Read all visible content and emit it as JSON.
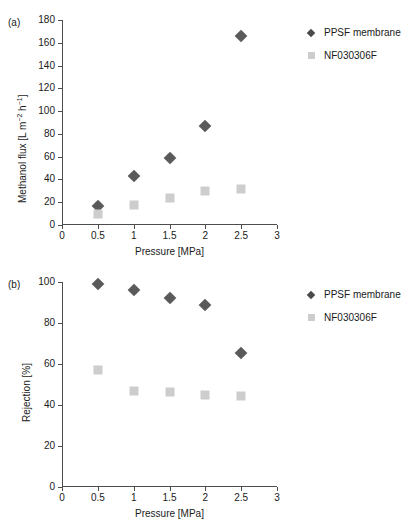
{
  "figure": {
    "panel_a_tag": "(a)",
    "panel_b_tag": "(b)"
  },
  "legend": {
    "series1_label": "PPSF membrane",
    "series2_label": "NF030306F",
    "series1_color": "#5a5a5a",
    "series2_color": "#cdcdcd",
    "series1_marker": "diamond",
    "series2_marker": "square",
    "position": "top-right"
  },
  "chart_data": [
    {
      "type": "scatter",
      "panel": "(a)",
      "title": "",
      "xlabel": "Pressure [MPa]",
      "ylabel": "Methanol flux [L m-2 h-1]",
      "ylabel_display": "Methanol flux [L m⁻² h⁻¹]",
      "x": [
        0.5,
        1,
        1.5,
        2,
        2.5
      ],
      "xlim": [
        0,
        3
      ],
      "ylim": [
        0,
        180
      ],
      "xticks": [
        0,
        0.5,
        1,
        1.5,
        2,
        2.5,
        3
      ],
      "xticklabels": [
        "0",
        "0.5",
        "1",
        "1.5",
        "2",
        "2.5",
        "3"
      ],
      "yticks": [
        0,
        20,
        40,
        60,
        80,
        100,
        120,
        140,
        160,
        180
      ],
      "yticklabels": [
        "0",
        "20",
        "40",
        "60",
        "80",
        "100",
        "120",
        "140",
        "160",
        "180"
      ],
      "grid": false,
      "series": [
        {
          "name": "PPSF membrane",
          "marker": "diamond",
          "color": "#5a5a5a",
          "values": [
            17,
            43,
            59,
            87,
            166
          ]
        },
        {
          "name": "NF030306F",
          "marker": "square",
          "color": "#cdcdcd",
          "values": [
            10,
            18,
            24,
            30,
            32
          ]
        }
      ]
    },
    {
      "type": "scatter",
      "panel": "(b)",
      "title": "",
      "xlabel": "Pressure [MPa]",
      "ylabel": "Rejection [%]",
      "ylabel_display": "Rejection [%]",
      "x": [
        0.5,
        1,
        1.5,
        2,
        2.5
      ],
      "xlim": [
        0,
        3
      ],
      "ylim": [
        0,
        100
      ],
      "xticks": [
        0,
        0.5,
        1,
        1.5,
        2,
        2.5,
        3
      ],
      "xticklabels": [
        "0",
        "0.5",
        "1",
        "1.5",
        "2",
        "2.5",
        "3"
      ],
      "yticks": [
        0,
        20,
        40,
        60,
        80,
        100
      ],
      "yticklabels": [
        "0",
        "20",
        "40",
        "60",
        "80",
        "100"
      ],
      "grid": false,
      "series": [
        {
          "name": "PPSF membrane",
          "marker": "diamond",
          "color": "#5a5a5a",
          "values": [
            99,
            96,
            92,
            89,
            65.5
          ]
        },
        {
          "name": "NF030306F",
          "marker": "square",
          "color": "#cdcdcd",
          "values": [
            57,
            47,
            46.5,
            45,
            44.5
          ]
        }
      ]
    }
  ]
}
